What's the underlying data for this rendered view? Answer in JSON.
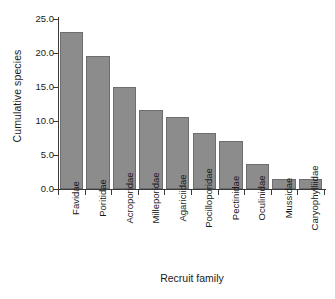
{
  "chart_data": {
    "type": "bar",
    "title": "",
    "xlabel": "Recruit family",
    "ylabel": "Cumulative species",
    "categories": [
      "Favidae",
      "Poritidae",
      "Acroporidae",
      "Milleporidae",
      "Agariciidae",
      "Pocilloporidae",
      "Pectinidae",
      "Oculinidae",
      "Mussidae",
      "Caryophylliidae"
    ],
    "values": [
      23.1,
      19.6,
      15.0,
      11.6,
      10.6,
      8.2,
      7.0,
      3.7,
      1.4,
      1.4
    ],
    "ylim": [
      0.0,
      25.0
    ],
    "ytick_values": [
      0.0,
      5.0,
      10.0,
      15.0,
      20.0,
      25.0
    ],
    "ytick_labels": [
      "0.0",
      "5.0",
      "10.0",
      "15.0",
      "20.0",
      "25.0"
    ],
    "grid": false,
    "legend": null,
    "bar_color": "#8c8c8c",
    "bar_edge_color": "#6e6e6e",
    "axis_color": "#3a3a3a",
    "background": "#ffffff"
  }
}
